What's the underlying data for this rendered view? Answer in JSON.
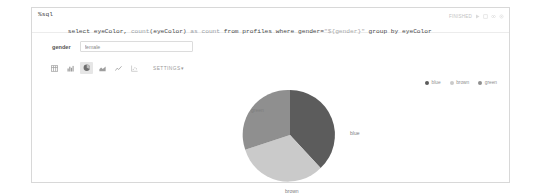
{
  "notebook": {
    "paragraph": {
      "interpreter": "%sql",
      "query_tokens": [
        {
          "t": "select ",
          "c": "plain"
        },
        {
          "t": "eyeColor",
          "c": "plain"
        },
        {
          "t": ", ",
          "c": "plain"
        },
        {
          "t": "count",
          "c": "fn"
        },
        {
          "t": "(eyeColor) ",
          "c": "plain"
        },
        {
          "t": "as ",
          "c": "fn"
        },
        {
          "t": "count ",
          "c": "fn"
        },
        {
          "t": "from ",
          "c": "plain"
        },
        {
          "t": "profiles ",
          "c": "plain"
        },
        {
          "t": "where ",
          "c": "plain"
        },
        {
          "t": "gender=",
          "c": "plain"
        },
        {
          "t": "\"${gender}\"",
          "c": "str"
        },
        {
          "t": " group by ",
          "c": "plain"
        },
        {
          "t": "eyeColor",
          "c": "plain"
        }
      ],
      "query_text": "select eyeColor, count(eyeColor) as count from profiles where gender=\"${gender}\" group by eyeColor",
      "status": "FINISHED",
      "status_icons": [
        {
          "name": "run-icon",
          "glyph": "play"
        },
        {
          "name": "hide-editor-icon",
          "glyph": "book"
        },
        {
          "name": "hide-output-icon",
          "glyph": "eye"
        },
        {
          "name": "settings-menu-icon",
          "glyph": "gear"
        }
      ]
    },
    "dynamic_form": {
      "label": "gender",
      "value": "female",
      "placeholder": "gender"
    },
    "viz_toolbar": {
      "buttons": [
        {
          "name": "table-chart",
          "icon": "table-icon",
          "selected": false
        },
        {
          "name": "bar-chart",
          "icon": "bar-chart-icon",
          "selected": false
        },
        {
          "name": "pie-chart",
          "icon": "pie-chart-icon",
          "selected": true
        },
        {
          "name": "area-chart",
          "icon": "area-chart-icon",
          "selected": false
        },
        {
          "name": "line-chart",
          "icon": "line-chart-icon",
          "selected": false
        },
        {
          "name": "scatter-chart",
          "icon": "scatter-chart-icon",
          "selected": false
        }
      ],
      "settings_label": "SETTINGS",
      "settings_caret": "▾"
    }
  },
  "chart_data": {
    "type": "pie",
    "title": "",
    "categories": [
      "blue",
      "brown",
      "green"
    ],
    "values": [
      38,
      33,
      29
    ],
    "colors": [
      "#5c5c5c",
      "#c9c9c9",
      "#8f8f8f"
    ],
    "legend": {
      "position": "top-right",
      "entries": [
        {
          "label": "blue",
          "color": "#5c5c5c"
        },
        {
          "label": "brown",
          "color": "#c9c9c9"
        },
        {
          "label": "green",
          "color": "#8f8f8f"
        }
      ]
    },
    "slice_labels": [
      {
        "label": "blue",
        "color": "#7d7d7d"
      },
      {
        "label": "brown",
        "color": "#7d7d7d"
      },
      {
        "label": "green",
        "color": "#7d7d7d"
      }
    ],
    "grid": false
  }
}
